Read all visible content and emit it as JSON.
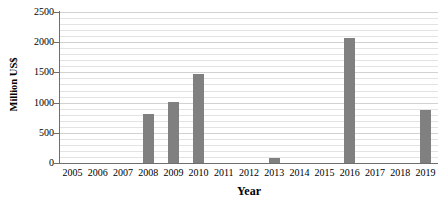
{
  "chart_data": {
    "type": "bar",
    "title": "",
    "xlabel": "Year",
    "ylabel": "Million US$",
    "categories": [
      "2005",
      "2006",
      "2007",
      "2008",
      "2009",
      "2010",
      "2011",
      "2012",
      "2013",
      "2014",
      "2015",
      "2016",
      "2017",
      "2018",
      "2019"
    ],
    "values": [
      0,
      0,
      0,
      810,
      1010,
      1480,
      0,
      0,
      80,
      0,
      0,
      2070,
      0,
      0,
      880
    ],
    "ylim": [
      0,
      2500
    ],
    "y_ticks": [
      0,
      500,
      1000,
      1500,
      2000,
      2500
    ],
    "y_tick_labels": [
      "0",
      "500",
      "1000",
      "1500",
      "2000",
      "2500"
    ],
    "y_minor_step": 100,
    "grid": "horizontal",
    "legend": "none",
    "series": [
      {
        "name": "Million US$",
        "color": "#808080",
        "values": [
          0,
          0,
          0,
          810,
          1010,
          1480,
          0,
          0,
          80,
          0,
          0,
          2070,
          0,
          0,
          880
        ]
      }
    ],
    "colors": {
      "bar": "#808080",
      "gridline": "#e3e3e3",
      "gridline_major": "#d2d2d2",
      "axis": "#6e6e6e",
      "text": "#000000",
      "background": "#ffffff"
    }
  }
}
